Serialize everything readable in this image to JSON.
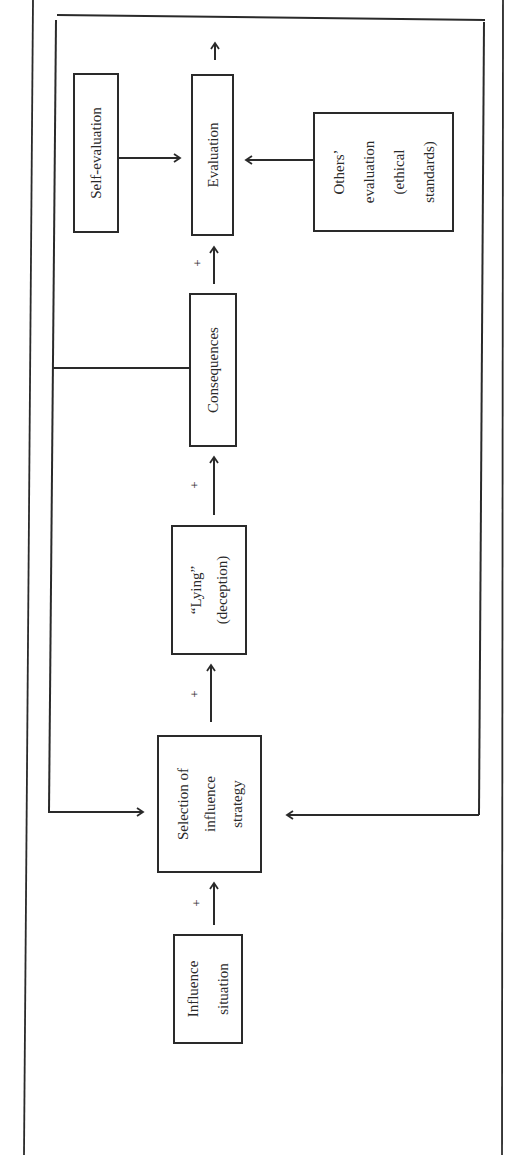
{
  "diagram": {
    "nodes": {
      "self_evaluation": {
        "line1": "Self-evaluation"
      },
      "evaluation": {
        "line1": "Evaluation"
      },
      "others_evaluation": {
        "line1": "Others’",
        "line2": "evaluation",
        "line3": "(ethical",
        "line4": "standards)"
      },
      "consequences": {
        "line1": "Consequences"
      },
      "lying": {
        "line1": "“Lying”",
        "line2": "(deception)"
      },
      "selection": {
        "line1": "Selection of",
        "line2": "influence",
        "line3": "strategy"
      },
      "influence_situation": {
        "line1": "Influence",
        "line2": "situation"
      }
    },
    "edge_labels": {
      "situation_to_selection": "+",
      "selection_to_lying": "+",
      "lying_to_consequences": "+",
      "consequences_to_evaluation": "+"
    },
    "colors": {
      "line": "#2a2a2a",
      "background": "#ffffff"
    }
  }
}
